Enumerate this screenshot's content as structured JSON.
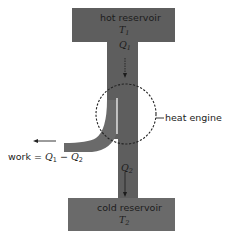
{
  "diagram": {
    "type": "heat engine schematic",
    "colors": {
      "reservoir_fill": "#5e5e5e",
      "pipe_fill": "#5e5e5e",
      "branch_fill": "#6a6a6a",
      "text_on_dark": "#1c1c1c",
      "text": "#222222",
      "dashed_circle": "#222222"
    },
    "hot_reservoir": {
      "label": "hot reservoir",
      "temperature_symbol": "T",
      "temperature_subscript": "1"
    },
    "heat_in": {
      "symbol": "Q",
      "subscript": "1"
    },
    "engine": {
      "label": "heat engine"
    },
    "work": {
      "prefix": "work = ",
      "q1_symbol": "Q",
      "q1_subscript": "1",
      "minus": " − ",
      "q2_symbol": "Q",
      "q2_subscript": "2"
    },
    "heat_out": {
      "symbol": "Q",
      "subscript": "2"
    },
    "cold_reservoir": {
      "label": "cold reservoir",
      "temperature_symbol": "T",
      "temperature_subscript": "2"
    }
  }
}
